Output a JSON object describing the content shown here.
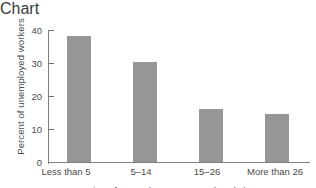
{
  "chart_data": {
    "type": "bar",
    "title": "",
    "categories": [
      "Less than 5",
      "5–14",
      "15–26",
      "More than 26"
    ],
    "values": [
      38,
      30.2,
      16,
      14.4
    ],
    "xlabel": "Duration of unemployment, 1997 (weeks)",
    "ylabel": "Percent of unemployed workers",
    "ylim": [
      0,
      40
    ],
    "yticks": [
      0,
      10,
      20,
      30,
      40
    ],
    "ytick_labels": [
      "0",
      "10",
      "20",
      "30",
      "40"
    ],
    "grid": false,
    "legend": false,
    "bar_color": "#969696",
    "axis_color": "#808080",
    "text_color": "#4a4a4a",
    "background": "#ffffff"
  }
}
